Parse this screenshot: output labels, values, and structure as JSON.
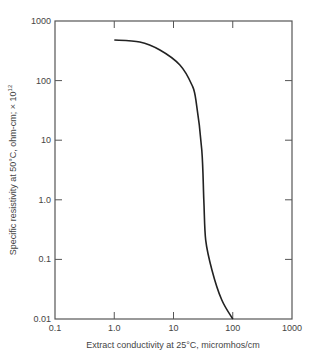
{
  "chart_data": {
    "type": "line",
    "title": "",
    "xlabel": "Extract conductivity at 25°C, micromhos/cm",
    "ylabel": "Specific resistivity at 50°C, ohm-cm; × 10",
    "ylabel_superscript": "12",
    "xscale": "log",
    "yscale": "log",
    "xlim": [
      0.1,
      1000
    ],
    "ylim": [
      0.01,
      1000
    ],
    "x_ticks": [
      "0.1",
      "1.0",
      "10",
      "100",
      "1000"
    ],
    "y_ticks": [
      "0.01",
      "0.1",
      "1.0",
      "10",
      "100",
      "1000"
    ],
    "grid": false,
    "legend": null,
    "series": [
      {
        "name": "resistivity vs conductivity",
        "x": [
          1.0,
          2.7,
          5.9,
          12.8,
          20.4,
          23.9,
          30,
          32.5,
          35,
          44.6,
          65,
          100
        ],
        "y": [
          480,
          445,
          326,
          183,
          85,
          47,
          6.8,
          1.0,
          0.21,
          0.066,
          0.021,
          0.01
        ]
      }
    ]
  },
  "colors": {
    "axis": "#555555",
    "curve": "#222222",
    "text": "#444444"
  }
}
